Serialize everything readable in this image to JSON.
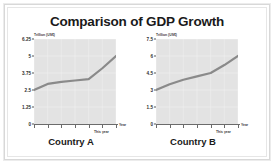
{
  "title": "Comparison of GDP Growth",
  "chart_data": [
    {
      "type": "line",
      "title": "Country A",
      "xlabel": "Year",
      "ylabel": "Trillion (US$)",
      "ylim": [
        0,
        6.25
      ],
      "yticks": [
        "0",
        "1.25",
        "2.5",
        "3.75",
        "5",
        "6.25"
      ],
      "ytick_values": [
        0,
        1.25,
        2.5,
        3.75,
        5,
        6.25
      ],
      "x": [
        0,
        1,
        2,
        3,
        4,
        5,
        6
      ],
      "values": [
        2.5,
        2.95,
        3.1,
        3.2,
        3.3,
        4.1,
        5.0
      ],
      "xtick_labels": [
        "",
        "",
        "",
        "",
        "",
        "This year",
        ""
      ],
      "annotations": [
        "This year",
        "Year"
      ],
      "grid": true,
      "legend": "none",
      "line_color": "#8a8a8a",
      "plot_bg": "#e3e3e3"
    },
    {
      "type": "line",
      "title": "Country B",
      "xlabel": "Year",
      "ylabel": "Trillion (US$)",
      "ylim": [
        0,
        7.5
      ],
      "yticks": [
        "0",
        "1.5",
        "3",
        "4.5",
        "6",
        "7.5"
      ],
      "ytick_values": [
        0,
        1.5,
        3,
        4.5,
        6,
        7.5
      ],
      "x": [
        0,
        1,
        2,
        3,
        4,
        5,
        6
      ],
      "values": [
        3.0,
        3.5,
        3.9,
        4.2,
        4.5,
        5.2,
        6.0
      ],
      "xtick_labels": [
        "",
        "",
        "",
        "",
        "",
        "This year",
        ""
      ],
      "annotations": [
        "This year",
        "Year"
      ],
      "grid": true,
      "legend": "none",
      "line_color": "#8a8a8a",
      "plot_bg": "#e3e3e3"
    }
  ],
  "panel_a": {
    "unit": "Trillion (US$)",
    "country": "Country A",
    "year_label": "Year",
    "this_year_label": "This year"
  },
  "panel_b": {
    "unit": "Trillion (US$)",
    "country": "Country B",
    "year_label": "Year",
    "this_year_label": "This year"
  },
  "colors": {
    "line": "#8a8a8a",
    "plot_bg": "#e3e3e3",
    "grid": "#f0f0f0",
    "axis": "#6b6b6b",
    "text": "#1a1a1a"
  }
}
